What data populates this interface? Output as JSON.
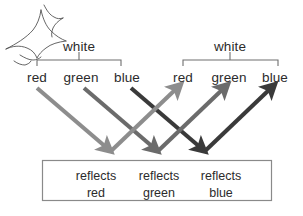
{
  "diagram": {
    "icon": {
      "name": "light-burst-icon",
      "label": "light source burst"
    },
    "source_group": {
      "white_label": "white",
      "components": [
        "red",
        "green",
        "blue"
      ]
    },
    "reflected_group": {
      "white_label": "white",
      "components": [
        "red",
        "green",
        "blue"
      ]
    },
    "surface_box": {
      "cells": [
        {
          "line1": "reflects",
          "line2": "red"
        },
        {
          "line1": "reflects",
          "line2": "green"
        },
        {
          "line1": "reflects",
          "line2": "blue"
        }
      ]
    },
    "rays": {
      "incoming": [
        {
          "name": "incoming-red-ray",
          "from": "red",
          "color": "#8d8d8d"
        },
        {
          "name": "incoming-green-ray",
          "from": "green",
          "color": "#6b6b6b"
        },
        {
          "name": "incoming-blue-ray",
          "from": "blue",
          "color": "#3a3a3a"
        }
      ],
      "outgoing": [
        {
          "name": "outgoing-red-ray",
          "to": "red",
          "color": "#8d8d8d"
        },
        {
          "name": "outgoing-green-ray",
          "to": "green",
          "color": "#6b6b6b"
        },
        {
          "name": "outgoing-blue-ray",
          "to": "blue",
          "color": "#3a3a3a"
        }
      ]
    },
    "colors": {
      "line": "#6e6e6e",
      "text": "#2b2b2b",
      "box_border": "#8a8a8a",
      "background": "#ffffff",
      "ray_light": "#8d8d8d",
      "ray_medium": "#6b6b6b",
      "ray_dark": "#3a3a3a"
    }
  }
}
